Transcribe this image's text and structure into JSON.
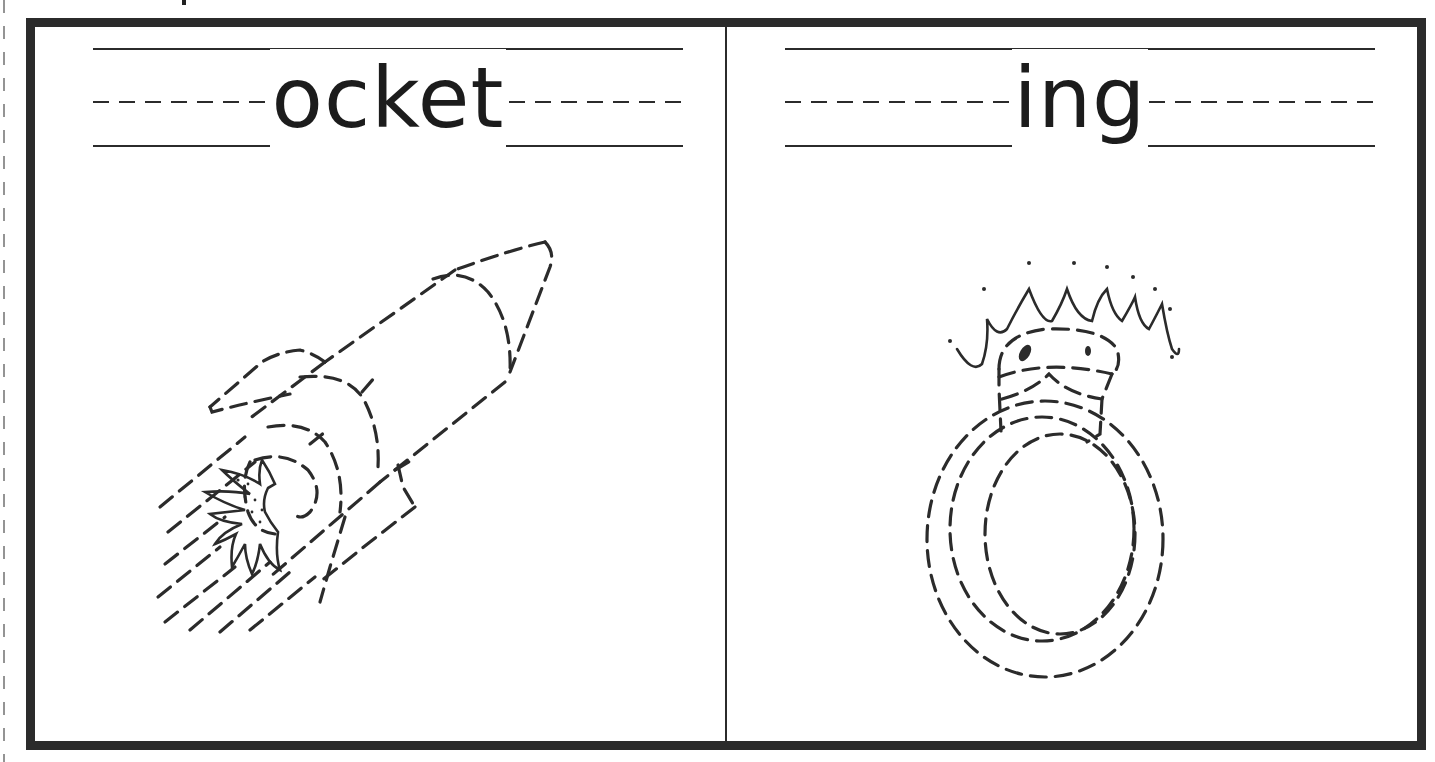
{
  "worksheet": {
    "panels": [
      {
        "word": "ocket",
        "picture": "rocket"
      },
      {
        "word": "ing",
        "picture": "ring"
      }
    ]
  },
  "colors": {
    "ink": "#2b2b2b",
    "paper": "#ffffff"
  }
}
